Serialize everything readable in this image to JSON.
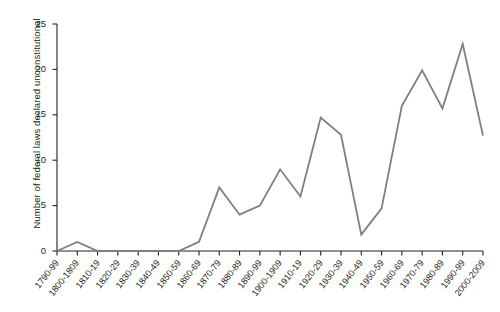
{
  "chart_data": {
    "type": "line",
    "title": "",
    "xlabel": "",
    "ylabel": "Number of federal laws declared unconstitutional",
    "categories": [
      "1790-99",
      "1800-1809",
      "1810-19",
      "1820-29",
      "1830-39",
      "1840-49",
      "1850-59",
      "1860-69",
      "1870-79",
      "1880-89",
      "1890-99",
      "1900-1909",
      "1910-19",
      "1920-29",
      "1930-39",
      "1940-49",
      "1950-59",
      "1960-69",
      "1970-79",
      "1980-89",
      "1990-99",
      "2000-2009"
    ],
    "values": [
      0,
      1,
      0,
      0,
      0,
      0,
      0,
      1,
      7,
      4,
      5,
      9,
      6,
      14.7,
      12.8,
      1.8,
      4.7,
      16,
      19.9,
      15.7,
      22.8,
      12.7
    ],
    "ylim": [
      0,
      25
    ],
    "yticks": [
      0,
      5,
      10,
      15,
      20,
      25
    ],
    "ytick_labels": [
      "0",
      "5",
      "10",
      "15",
      "20",
      "25"
    ],
    "grid": false,
    "legend": null,
    "line_color": "#7f7f7f",
    "axis_color": "#231f20",
    "background": "#ffffff"
  }
}
